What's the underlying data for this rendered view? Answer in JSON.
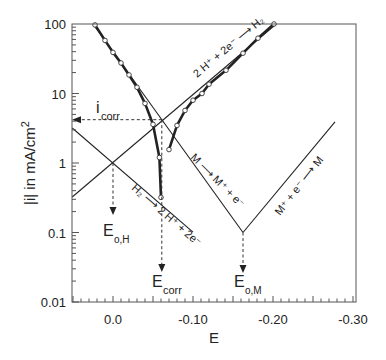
{
  "chart_data": {
    "type": "line",
    "title": "",
    "xlabel": "E",
    "ylabel": "|i| in mA/cm²",
    "ylabel_parts": {
      "main": "|i| in mA/cm",
      "sup": "2"
    },
    "yscale": "log",
    "xlim": [
      0.05,
      -0.3
    ],
    "ylim": [
      0.01,
      100
    ],
    "x_ticks": [
      {
        "value": 0.0,
        "label": "0.0"
      },
      {
        "value": -0.1,
        "label": "-0.10"
      },
      {
        "value": -0.2,
        "label": "-0.20"
      },
      {
        "value": -0.3,
        "label": "-0.30"
      }
    ],
    "y_ticks": [
      {
        "value": 100,
        "label": "100"
      },
      {
        "value": 10,
        "label": "10"
      },
      {
        "value": 1,
        "label": "1"
      },
      {
        "value": 0.1,
        "label": "0.1"
      },
      {
        "value": 0.01,
        "label": "0.01"
      }
    ],
    "grid": false,
    "series": [
      {
        "name": "H2 -> 2H+ + 2e- (anodic hydrogen Tafel line)",
        "style": "thin",
        "points": [
          [
            0.051,
            3.19
          ],
          [
            -0.1,
            0.101
          ]
        ]
      },
      {
        "name": "2H+ + 2e- -> H2 (cathodic hydrogen Tafel line)",
        "style": "thin",
        "points": [
          [
            0.051,
            0.324
          ],
          [
            -0.204,
            100
          ]
        ]
      },
      {
        "name": "M -> M+ + e- (anodic metal Tafel line)",
        "style": "thin",
        "points": [
          [
            0.025,
            100
          ],
          [
            -0.1625,
            0.1
          ]
        ]
      },
      {
        "name": "M+ + e- -> M (cathodic metal Tafel line)",
        "style": "thin",
        "points": [
          [
            -0.1625,
            0.1
          ],
          [
            -0.2775,
            3.9
          ]
        ]
      },
      {
        "name": "Measured anodic curve",
        "style": "thick-markers",
        "points": [
          [
            0.0225,
            97
          ],
          [
            0.01,
            58
          ],
          [
            0.0,
            39
          ],
          [
            -0.01,
            27.5
          ],
          [
            -0.02,
            18.5
          ],
          [
            -0.03,
            12.3
          ],
          [
            -0.04,
            7.2
          ],
          [
            -0.05,
            3.6
          ],
          [
            -0.058,
            1.2
          ],
          [
            -0.06,
            0.32
          ]
        ]
      },
      {
        "name": "Measured cathodic curve",
        "style": "thick-markers",
        "points": [
          [
            -0.20125,
            100
          ],
          [
            -0.18125,
            62.5
          ],
          [
            -0.1625,
            38
          ],
          [
            -0.14125,
            21.6
          ],
          [
            -0.12,
            13.6
          ],
          [
            -0.11125,
            10.0
          ],
          [
            -0.1,
            8.0
          ],
          [
            -0.09,
            5.7
          ],
          [
            -0.08,
            3.47
          ],
          [
            -0.07,
            1.56
          ]
        ]
      }
    ],
    "markers": {
      "E_oH": {
        "E": 0.0,
        "i": 1.0
      },
      "E_corr": {
        "E": -0.061,
        "i": 4.2
      },
      "E_oM": {
        "E": -0.1625,
        "i": 0.1
      },
      "i_corr": 4.2
    },
    "annotations": [
      {
        "id": "i_corr",
        "main": "i",
        "sub": "corr"
      },
      {
        "id": "E_oH",
        "main": "E",
        "sub": "o,H"
      },
      {
        "id": "E_corr",
        "main": "E",
        "sub": "corr"
      },
      {
        "id": "E_oM",
        "main": "E",
        "sub": "o,M"
      },
      {
        "id": "cathodic_H",
        "text": "2 H⁺ + 2e⁻ ⟶ H₂"
      },
      {
        "id": "anodic_H",
        "text": "H₂ ⟶ 2 H⁺ + 2e⁻"
      },
      {
        "id": "anodic_M",
        "text": "M ⟶ M⁺ + e⁻"
      },
      {
        "id": "cathodic_M",
        "text": "M⁺ + e⁻ ⟶ M"
      }
    ]
  }
}
